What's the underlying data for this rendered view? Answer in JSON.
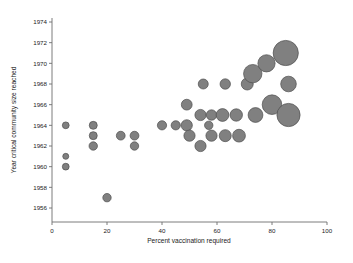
{
  "chart_data": {
    "type": "scatter",
    "title": "",
    "subtitle": "",
    "xlabel": "Percent vaccination required",
    "ylabel": "Year critical community size reached",
    "xlim": [
      0,
      100
    ],
    "ylim": [
      1955,
      1975
    ],
    "xticks": [
      "0",
      "20",
      "40",
      "60",
      "80",
      "100"
    ],
    "xtick_values": [
      0,
      20,
      40,
      60,
      80,
      100
    ],
    "yticks": [
      "1956",
      "1958",
      "1960",
      "1962",
      "1964",
      "1966",
      "1968",
      "1970",
      "1972",
      "1974"
    ],
    "ytick_values": [
      1956,
      1958,
      1960,
      1962,
      1964,
      1966,
      1968,
      1970,
      1972,
      1974
    ],
    "grid": false,
    "legend": null,
    "marker_shape": "circle",
    "marker_fill": "#808080",
    "marker_stroke": "#4d4d4d",
    "size_encodes": "population size (bubble area)",
    "points": [
      {
        "x": 5,
        "y": 1964,
        "r": 3.4
      },
      {
        "x": 5,
        "y": 1961,
        "r": 3.0
      },
      {
        "x": 5,
        "y": 1960,
        "r": 3.4
      },
      {
        "x": 15,
        "y": 1964,
        "r": 4.0
      },
      {
        "x": 15,
        "y": 1963,
        "r": 4.0
      },
      {
        "x": 15,
        "y": 1962,
        "r": 4.2
      },
      {
        "x": 20,
        "y": 1957,
        "r": 4.2
      },
      {
        "x": 25,
        "y": 1963,
        "r": 4.4
      },
      {
        "x": 30,
        "y": 1963,
        "r": 4.4
      },
      {
        "x": 30,
        "y": 1962,
        "r": 4.2
      },
      {
        "x": 40,
        "y": 1964,
        "r": 4.6
      },
      {
        "x": 45,
        "y": 1964,
        "r": 4.6
      },
      {
        "x": 49,
        "y": 1966,
        "r": 5.4
      },
      {
        "x": 49,
        "y": 1964,
        "r": 5.6
      },
      {
        "x": 50,
        "y": 1963,
        "r": 5.6
      },
      {
        "x": 55,
        "y": 1968,
        "r": 5.0
      },
      {
        "x": 54,
        "y": 1965,
        "r": 5.6
      },
      {
        "x": 54,
        "y": 1962,
        "r": 5.6
      },
      {
        "x": 57,
        "y": 1964,
        "r": 4.2
      },
      {
        "x": 58,
        "y": 1965,
        "r": 5.2
      },
      {
        "x": 58,
        "y": 1963,
        "r": 5.6
      },
      {
        "x": 63,
        "y": 1968,
        "r": 5.2
      },
      {
        "x": 62,
        "y": 1965,
        "r": 6.4
      },
      {
        "x": 63,
        "y": 1963,
        "r": 6.0
      },
      {
        "x": 67,
        "y": 1965,
        "r": 6.2
      },
      {
        "x": 68,
        "y": 1963,
        "r": 6.4
      },
      {
        "x": 71,
        "y": 1968,
        "r": 6.0
      },
      {
        "x": 73,
        "y": 1969,
        "r": 9.2
      },
      {
        "x": 74,
        "y": 1965,
        "r": 7.4
      },
      {
        "x": 78,
        "y": 1970,
        "r": 8.6
      },
      {
        "x": 80,
        "y": 1966,
        "r": 9.8
      },
      {
        "x": 85,
        "y": 1971,
        "r": 12.6
      },
      {
        "x": 86,
        "y": 1968,
        "r": 7.8
      },
      {
        "x": 86,
        "y": 1965,
        "r": 11.6
      }
    ]
  },
  "axes": {
    "x_axis_name": "x-axis",
    "y_axis_name": "y-axis"
  }
}
